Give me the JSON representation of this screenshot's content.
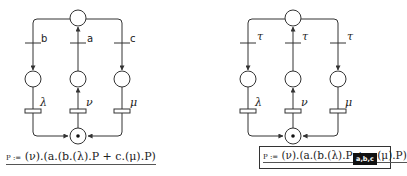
{
  "diagrams": [
    {
      "id": "left",
      "transition_labels": {
        "left": "b",
        "middle": "a",
        "right": "c"
      },
      "rate_labels": {
        "left": "λ",
        "middle": "ν",
        "right": "μ"
      },
      "formula": {
        "prefix": "P :=",
        "body": "(ν).(a.(b.(λ).P + c.(μ).P)"
      },
      "token_in_bottom_place": true
    },
    {
      "id": "right",
      "transition_labels": {
        "left": "τ",
        "middle": "τ",
        "right": "τ"
      },
      "rate_labels": {
        "left": "λ",
        "middle": "ν",
        "right": "μ"
      },
      "formula": {
        "prefix": "P :=",
        "body": "(ν).(a.(b.(λ).P + c.(μ).P)"
      },
      "badge": "a,b,c",
      "token_in_bottom_place": true
    }
  ]
}
